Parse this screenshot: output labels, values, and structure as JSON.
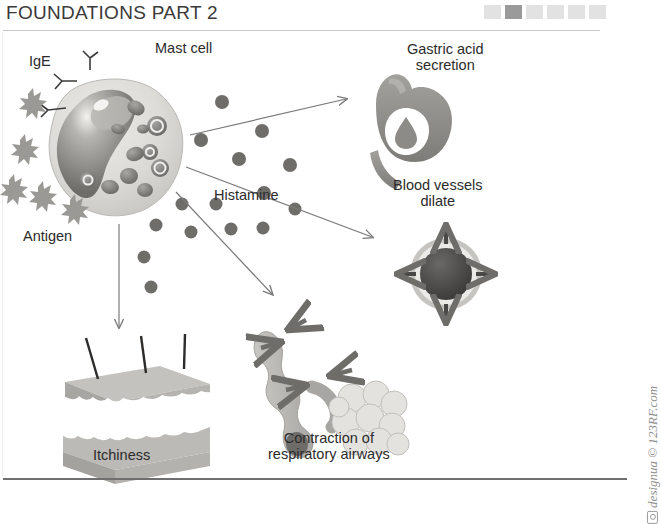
{
  "header": {
    "title": "FOUNDATIONS PART 2",
    "progress": {
      "total": 6,
      "active_index": 1,
      "inactive_color": "#e2e2e2",
      "active_color": "#9a9a9a"
    }
  },
  "diagram": {
    "name": "mast-cell-histamine-allergic-response",
    "labels": {
      "ige": "IgE",
      "mast_cell": "Mast cell",
      "antigen": "Antigen",
      "histamine": "Histamine",
      "gastric_acid": "Gastric acid\nsecretion",
      "blood_vessels": "Blood vessels\ndilate",
      "itchiness": "Itchiness",
      "airways": "Contraction of\nrespiratory airways"
    },
    "colors": {
      "cell_body": "#d8d6d2",
      "cell_nucleus": "#8e8c88",
      "granule": "#7d7b78",
      "antigen": "#9b9996",
      "organ": "#8f8d8a",
      "vessel_lumen": "#4f4d4b",
      "arrow": "#7a7a7a",
      "text": "#2b2b2b"
    }
  },
  "watermark": {
    "text": "designua © 123RF.com",
    "icon": "camera-icon"
  }
}
